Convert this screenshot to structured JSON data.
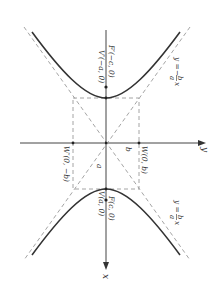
{
  "figure": {
    "type": "hyperbola",
    "orientation": "rotated 90° (x-axis vertical, pointing down)",
    "colors": {
      "curve": "#333333",
      "axes": "#444444",
      "dashed": "#9a9a9a",
      "text": "#333333",
      "background": "#ffffff"
    },
    "axes": {
      "x_label": "x",
      "y_label": "y"
    },
    "points": {
      "F_prime": "F′(−c, 0)",
      "V_prime": "V′(−a, 0)",
      "F": "F(c, 0)",
      "V": "V(a, 0)",
      "W": "W(0, b)",
      "W_prime": "W′(0, −b)"
    },
    "segment_labels": {
      "a": "a",
      "b": "b"
    },
    "asymptotes": {
      "upper": {
        "lhs": "y =",
        "num": "b",
        "den": "a",
        "var": "x",
        "sign": "−"
      },
      "lower": {
        "lhs": "y =",
        "num": "b",
        "den": "a",
        "var": "x",
        "sign": ""
      }
    }
  }
}
